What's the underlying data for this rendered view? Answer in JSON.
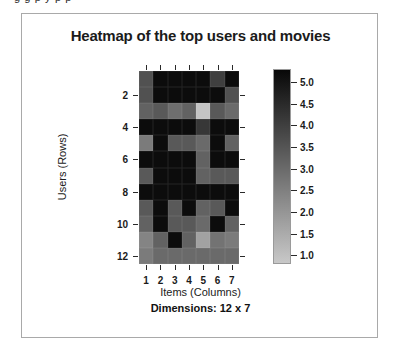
{
  "document_strip": {
    "clipped_line": "g   g    p  y        p         p"
  },
  "figure": {
    "title": "Heatmap of the top users and movies",
    "dimensions_note": "Dimensions: 12 x 7",
    "frame_color": "#a9a9a9",
    "background": "#ffffff"
  },
  "chart_data": {
    "type": "heatmap",
    "title": "Heatmap of the top users and movies",
    "xlabel": "Items (Columns)",
    "ylabel": "Users (Rows)",
    "grid": false,
    "legend_position": "right",
    "x_tick_labels": [
      "1",
      "2",
      "3",
      "4",
      "5",
      "6",
      "7"
    ],
    "y_tick_labels": [
      "2",
      "4",
      "6",
      "8",
      "10",
      "12"
    ],
    "y_tick_rows": [
      2,
      4,
      6,
      8,
      10,
      12
    ],
    "columns": [
      1,
      2,
      3,
      4,
      5,
      6,
      7
    ],
    "rows": [
      1,
      2,
      3,
      4,
      5,
      6,
      7,
      8,
      9,
      10,
      11,
      12
    ],
    "n_rows": 12,
    "n_cols": 7,
    "colorbar": {
      "ticks": [
        "5.0",
        "4.5",
        "4.0",
        "3.5",
        "3.0",
        "2.5",
        "2.0",
        "1.5",
        "1.0"
      ],
      "tick_values": [
        5.0,
        4.5,
        4.0,
        3.5,
        3.0,
        2.5,
        2.0,
        1.5,
        1.0
      ],
      "vmin": 0.8,
      "vmax": 5.3,
      "colormap": "grey (light = low, dark = high)",
      "low_color": "#b4b4b4",
      "high_color": "#0a0a0a"
    },
    "values": [
      [
        3.6,
        5.2,
        5.2,
        5.2,
        5.2,
        4.0,
        5.2
      ],
      [
        3.6,
        5.2,
        5.2,
        5.2,
        5.2,
        5.2,
        3.6
      ],
      [
        3.2,
        3.4,
        2.9,
        3.2,
        0.9,
        3.4,
        3.0
      ],
      [
        5.2,
        5.2,
        5.2,
        5.2,
        4.2,
        5.2,
        5.2
      ],
      [
        2.6,
        5.2,
        3.4,
        3.4,
        3.0,
        5.2,
        3.2
      ],
      [
        5.2,
        5.2,
        5.2,
        5.2,
        3.2,
        5.2,
        5.2
      ],
      [
        3.4,
        5.2,
        5.2,
        5.2,
        3.2,
        3.4,
        3.4
      ],
      [
        5.2,
        5.2,
        5.2,
        5.2,
        5.2,
        5.2,
        5.2
      ],
      [
        3.4,
        5.2,
        3.4,
        5.2,
        3.2,
        3.4,
        5.2
      ],
      [
        3.2,
        5.2,
        3.4,
        3.4,
        3.0,
        5.2,
        3.2
      ],
      [
        2.4,
        3.2,
        5.2,
        3.2,
        1.7,
        2.8,
        2.6
      ],
      [
        2.6,
        3.0,
        3.0,
        3.0,
        3.0,
        3.0,
        3.0
      ]
    ]
  }
}
